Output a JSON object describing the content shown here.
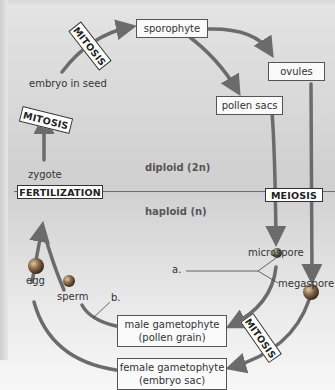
{
  "diagram": {
    "ploidy": {
      "diploid": "diploid (2n)",
      "haploid": "haploid (n)"
    },
    "boxes": {
      "sporophyte": "sporophyte",
      "ovules": "ovules",
      "pollen_sacs": "pollen sacs",
      "male_gametophyte_line1": "male gametophyte",
      "male_gametophyte_line2": "(pollen grain)",
      "female_gametophyte_line1": "female gametophyte",
      "female_gametophyte_line2": "(embryo sac)"
    },
    "labels": {
      "embryo_in_seed": "embryo in seed",
      "zygote": "zygote",
      "microspore": "microspore",
      "megaspore": "megaspore",
      "egg": "egg",
      "sperm": "sperm",
      "a": "a.",
      "b": "b."
    },
    "processes": {
      "mitosis_top": "MITOSIS",
      "mitosis_left": "MITOSIS",
      "fertilization": "FERTILIZATION",
      "meiosis": "MEIOSIS",
      "mitosis_bottom": "MITOSIS"
    },
    "colors": {
      "arrow": "#6b6b6b",
      "box_border": "#555555",
      "background_top": "#e4e4e4",
      "background_mid": "#d0d0d0",
      "background_bottom": "#f7f7f7",
      "spore_ball": "#8a6a4a"
    }
  }
}
